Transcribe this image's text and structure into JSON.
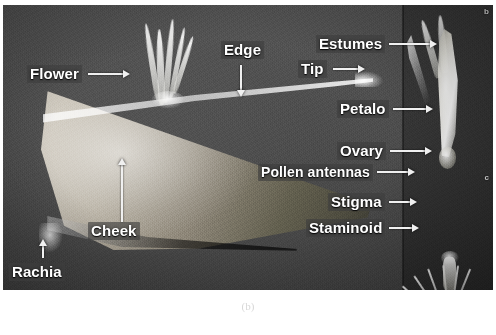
{
  "figure": {
    "caption": "(b)",
    "panel_markers": {
      "upper_right": "b",
      "lower_right": "c"
    },
    "colors": {
      "background_dark": "#4a4a4a",
      "panel_side_dark": "#343434",
      "label_text": "#ffffff",
      "label_backdrop": "#3e3e3e",
      "arrow": "#f0f0f0",
      "tissue_light": "#cfc9bd"
    }
  },
  "annotations": [
    {
      "id": "flower",
      "label": "Flower",
      "arrow": "arrow-right",
      "icon": "arrow-right-icon"
    },
    {
      "id": "edge",
      "label": "Edge",
      "arrow": "arrow-down",
      "icon": "arrow-down-icon"
    },
    {
      "id": "estumes",
      "label": "Estumes",
      "arrow": "arrow-right",
      "icon": "arrow-right-icon"
    },
    {
      "id": "tip",
      "label": "Tip",
      "arrow": "arrow-right",
      "icon": "arrow-right-icon"
    },
    {
      "id": "petalo",
      "label": "Petalo",
      "arrow": "arrow-right",
      "icon": "arrow-right-icon"
    },
    {
      "id": "ovary",
      "label": "Ovary",
      "arrow": "arrow-right",
      "icon": "arrow-right-icon"
    },
    {
      "id": "pollen-antennas",
      "label": "Pollen antennas",
      "arrow": "arrow-right",
      "icon": "arrow-right-icon"
    },
    {
      "id": "stigma",
      "label": "Stigma",
      "arrow": "arrow-right",
      "icon": "arrow-right-icon"
    },
    {
      "id": "staminoid",
      "label": "Staminoid",
      "arrow": "arrow-right",
      "icon": "arrow-right-icon"
    },
    {
      "id": "cheek",
      "label": "Cheek",
      "arrow": "arrow-up",
      "icon": "arrow-up-icon"
    },
    {
      "id": "rachia",
      "label": "Rachia",
      "arrow": "arrow-up",
      "icon": "arrow-up-icon"
    }
  ]
}
